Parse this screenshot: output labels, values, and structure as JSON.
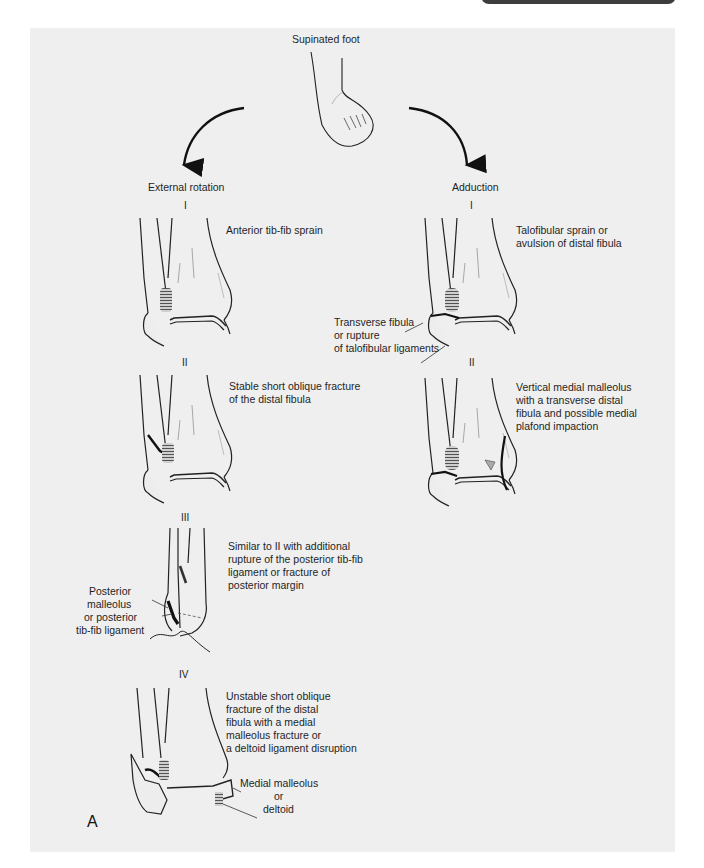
{
  "figure": {
    "letter": "A",
    "top_label": "Supinated foot",
    "columns": [
      {
        "title": "External rotation",
        "stages": [
          {
            "numeral": "I",
            "description": [
              "Anterior tib-fib sprain"
            ]
          },
          {
            "numeral": "II",
            "description": [
              "Stable short oblique fracture",
              "of the distal fibula"
            ]
          },
          {
            "numeral": "III",
            "description": [
              "Similar to II with additional",
              "rupture of the posterior tib-fib",
              "ligament or fracture of",
              "posterior margin"
            ],
            "callout": [
              "Posterior",
              "malleolus",
              "or posterior",
              "tib-fib ligament"
            ]
          },
          {
            "numeral": "IV",
            "description": [
              "Unstable short oblique",
              "fracture of the distal",
              "fibula with a medial",
              "malleolus fracture or",
              "a deltoid ligament disruption"
            ],
            "callout": [
              "Medial malleolus",
              "or",
              "deltoid"
            ]
          }
        ]
      },
      {
        "title": "Adduction",
        "stages": [
          {
            "numeral": "I",
            "description": [
              "Talofibular sprain or",
              "avulsion of distal fibula"
            ],
            "callout": [
              "Transverse fibula",
              "or rupture",
              "of talofibular ligaments"
            ]
          },
          {
            "numeral": "II",
            "description": [
              "Vertical medial malleolus",
              "with a transverse distal",
              "fibula and possible medial",
              "plafond impaction"
            ]
          }
        ]
      }
    ]
  }
}
